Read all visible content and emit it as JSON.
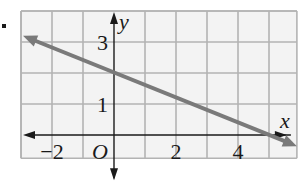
{
  "chart_data": {
    "type": "line",
    "title": "",
    "xlabel": "x",
    "ylabel": "y",
    "origin_label": "O",
    "xlim": [
      -3,
      5.9
    ],
    "ylim": [
      -0.75,
      4
    ],
    "grid": true,
    "grid_step": 1,
    "x_ticks": [
      {
        "value": -2,
        "label": "−2"
      },
      {
        "value": 2,
        "label": "2"
      },
      {
        "value": 4,
        "label": "4"
      }
    ],
    "y_ticks": [
      {
        "value": 1,
        "label": "1"
      },
      {
        "value": 3,
        "label": "3"
      }
    ],
    "series": [
      {
        "name": "line",
        "equation": "y = -0.4x + 2",
        "x": [
          -3,
          5.9
        ],
        "y": [
          3.2,
          -0.36
        ],
        "arrows": "both",
        "color": "#7a7a7a"
      }
    ]
  },
  "bullet": "•"
}
